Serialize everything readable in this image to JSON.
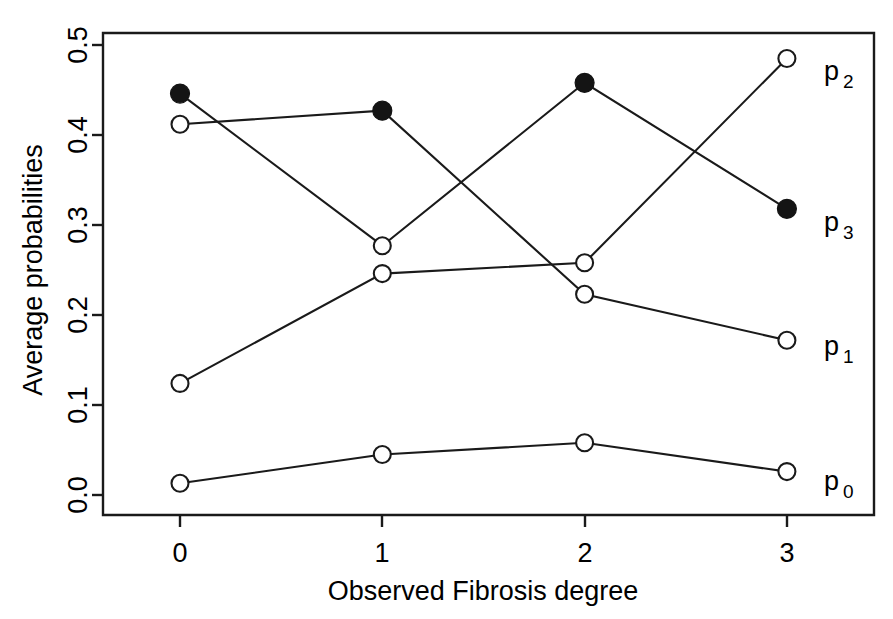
{
  "chart_data": {
    "type": "line",
    "title": "",
    "subtitle": "",
    "xlabel": "Observed Fibrosis degree",
    "ylabel": "Average probabilities",
    "x": [
      0,
      1,
      2,
      3
    ],
    "xticklabels": [
      "0",
      "1",
      "2",
      "3"
    ],
    "yticklabels": [
      "0.0",
      "0.1",
      "0.2",
      "0.3",
      "0.4",
      "0.5"
    ],
    "yticks": [
      0.0,
      0.1,
      0.2,
      0.3,
      0.4,
      0.5
    ],
    "xlim": [
      -0.45,
      3.6
    ],
    "ylim": [
      0.0,
      0.5
    ],
    "grid": false,
    "legend": "right-inline-labels",
    "series": [
      {
        "name": "p0",
        "label": "p",
        "label_sub": "0",
        "marker": "open-circle",
        "values": [
          0.013,
          0.045,
          0.058,
          0.026
        ]
      },
      {
        "name": "p1",
        "label": "p",
        "label_sub": "1",
        "marker": "open-circle",
        "values": [
          0.412,
          0.427,
          0.223,
          0.172
        ]
      },
      {
        "name": "p2",
        "label": "p",
        "label_sub": "2",
        "marker": "open-circle",
        "values": [
          0.124,
          0.246,
          0.258,
          0.485
        ]
      },
      {
        "name": "p3",
        "label": "p",
        "label_sub": "3",
        "marker": "filled-circle",
        "values": [
          0.446,
          0.277,
          0.458,
          0.318
        ]
      }
    ],
    "marker_overrides": [
      {
        "series": "p1",
        "x": 1,
        "marker": "filled-circle"
      },
      {
        "series": "p3",
        "x": 1,
        "marker": "open-circle"
      },
      {
        "series": "p2",
        "x": 2,
        "marker": "open-circle"
      },
      {
        "series": "p3",
        "x": 2,
        "marker": "filled-circle"
      }
    ]
  },
  "axes": {
    "y_title": "Average probabilities",
    "x_title": "Observed Fibrosis degree",
    "y_ticks": [
      "0.0",
      "0.1",
      "0.2",
      "0.3",
      "0.4",
      "0.5"
    ],
    "x_ticks": [
      "0",
      "1",
      "2",
      "3"
    ]
  },
  "series_labels": [
    {
      "base": "p",
      "sub": "2",
      "name": "label-p2"
    },
    {
      "base": "p",
      "sub": "3",
      "name": "label-p3"
    },
    {
      "base": "p",
      "sub": "1",
      "name": "label-p1"
    },
    {
      "base": "p",
      "sub": "0",
      "name": "label-p0"
    }
  ],
  "colors": {
    "ink": "#1a1a1a",
    "background": "#ffffff",
    "marker_fill_open": "#ffffff",
    "marker_fill_closed": "#141414"
  }
}
